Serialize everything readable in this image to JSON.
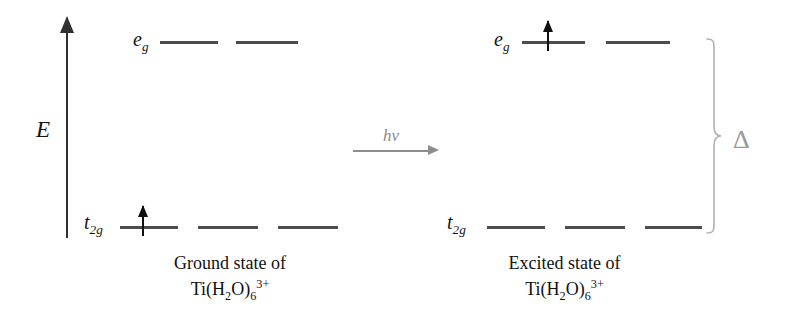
{
  "axis": {
    "label": "E",
    "icon": "up-arrow-icon"
  },
  "transition": {
    "label": "hv",
    "icon": "right-arrow-icon"
  },
  "splitting": {
    "label": "Δ",
    "bracket_icon": "right-curly-brace-icon"
  },
  "states": [
    {
      "id": "ground",
      "caption_line1": "Ground state of",
      "formula": {
        "element": "Ti(H",
        "sub1": "2",
        "mid": "O)",
        "sub2": "6",
        "charge": "3+"
      },
      "levels": [
        {
          "term": "t",
          "term_sub": "2g",
          "orbitals": 3,
          "electrons": [
            1,
            0,
            0
          ]
        },
        {
          "term": "e",
          "term_sub": "g",
          "orbitals": 2,
          "electrons": [
            0,
            0
          ]
        }
      ]
    },
    {
      "id": "excited",
      "caption_line1": "Excited state of",
      "formula": {
        "element": "Ti(H",
        "sub1": "2",
        "mid": "O)",
        "sub2": "6",
        "charge": "3+"
      },
      "levels": [
        {
          "term": "t",
          "term_sub": "2g",
          "orbitals": 3,
          "electrons": [
            0,
            0,
            0
          ]
        },
        {
          "term": "e",
          "term_sub": "g",
          "orbitals": 2,
          "electrons": [
            1,
            0
          ]
        }
      ]
    }
  ],
  "colors": {
    "level_line": "#4c4c4c",
    "axis": "#303030",
    "electron": "#101010",
    "hv_arrow": "#8d8d8d",
    "bracket": "#b0b0b0",
    "delta": "#9a9a9a",
    "background": "#ffffff"
  }
}
